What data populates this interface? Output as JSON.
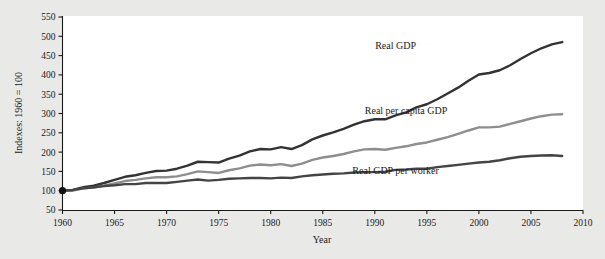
{
  "chart_data": {
    "type": "line",
    "title": "",
    "xlabel": "Year",
    "ylabel": "Indexes: 1960 = 100",
    "xlim": [
      1960,
      2010
    ],
    "ylim": [
      50,
      550
    ],
    "grid": false,
    "legend_position": "inline-annotations",
    "xticks": [
      1960,
      1965,
      1970,
      1975,
      1980,
      1985,
      1990,
      1995,
      2000,
      2005,
      2010
    ],
    "yticks": [
      50,
      100,
      150,
      200,
      250,
      300,
      350,
      400,
      450,
      500,
      550
    ],
    "x": [
      1960,
      1961,
      1962,
      1963,
      1964,
      1965,
      1966,
      1967,
      1968,
      1969,
      1970,
      1971,
      1972,
      1973,
      1974,
      1975,
      1976,
      1977,
      1978,
      1979,
      1980,
      1981,
      1982,
      1983,
      1984,
      1985,
      1986,
      1987,
      1988,
      1989,
      1990,
      1991,
      1992,
      1993,
      1994,
      1995,
      1996,
      1997,
      1998,
      1999,
      2000,
      2001,
      2002,
      2003,
      2004,
      2005,
      2006,
      2007,
      2008
    ],
    "series": [
      {
        "name": "Real GDP",
        "color": "#333333",
        "label_x": 1992,
        "label_y": 468,
        "end_value": 517,
        "values": [
          100,
          102,
          109,
          113,
          120,
          128,
          136,
          140,
          146,
          151,
          152,
          157,
          165,
          175,
          174,
          173,
          183,
          191,
          202,
          208,
          207,
          213,
          208,
          218,
          233,
          243,
          251,
          260,
          271,
          280,
          285,
          285,
          295,
          303,
          316,
          324,
          337,
          352,
          367,
          385,
          401,
          405,
          412,
          425,
          441,
          456,
          469,
          479,
          485
        ]
      },
      {
        "name": "Real per capita GDP",
        "color": "#8e8e8e",
        "label_x": 1993,
        "label_y": 300,
        "end_value": 278,
        "values": [
          100,
          100,
          106,
          108,
          113,
          119,
          125,
          128,
          132,
          135,
          135,
          137,
          143,
          150,
          148,
          146,
          153,
          158,
          165,
          168,
          166,
          169,
          164,
          170,
          180,
          186,
          190,
          195,
          202,
          207,
          208,
          206,
          211,
          215,
          221,
          225,
          232,
          239,
          247,
          256,
          264,
          264,
          266,
          273,
          280,
          287,
          293,
          297,
          298
        ]
      },
      {
        "name": "Real GDP per worker",
        "color": "#444444",
        "label_x": 1992,
        "label_y": 143,
        "end_value": 180,
        "values": [
          100,
          102,
          106,
          109,
          112,
          114,
          117,
          117,
          120,
          120,
          120,
          123,
          126,
          129,
          126,
          128,
          131,
          132,
          133,
          133,
          132,
          134,
          133,
          137,
          140,
          142,
          144,
          145,
          147,
          148,
          148,
          149,
          154,
          155,
          157,
          157,
          161,
          164,
          167,
          170,
          173,
          175,
          179,
          184,
          188,
          190,
          191,
          192,
          190
        ]
      }
    ]
  },
  "marker": {
    "name": "origin-marker",
    "x": 1960,
    "y": 100
  }
}
